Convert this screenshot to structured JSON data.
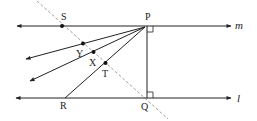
{
  "diagram": {
    "type": "geometry",
    "colors": {
      "line": "#222222",
      "dashed": "#888888",
      "background": "#ffffff"
    },
    "lines": {
      "m": {
        "label": "m"
      },
      "l": {
        "label": "l"
      }
    },
    "points": {
      "P": {
        "label": "P"
      },
      "Q": {
        "label": "Q"
      },
      "R": {
        "label": "R"
      },
      "S": {
        "label": "S"
      },
      "T": {
        "label": "T"
      },
      "X": {
        "label": "X"
      },
      "Y": {
        "label": "Y"
      }
    },
    "right_angles": [
      "at P between m and PQ",
      "at Q between l and PQ"
    ],
    "dashed_line": "through S, Y, X, T, Q"
  }
}
